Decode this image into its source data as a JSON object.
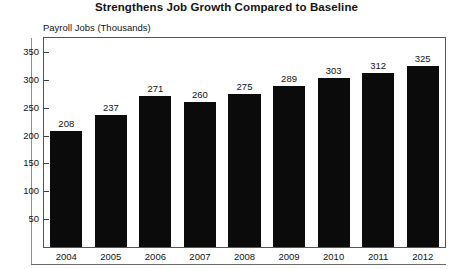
{
  "chart_data": {
    "type": "bar",
    "title": "Strengthens Job Growth Compared to Baseline",
    "ylabel": "Payroll Jobs (Thousands)",
    "xlabel": "",
    "categories": [
      "2004",
      "2005",
      "2006",
      "2007",
      "2008",
      "2009",
      "2010",
      "2011",
      "2012"
    ],
    "values": [
      208,
      237,
      271,
      260,
      275,
      289,
      303,
      312,
      325
    ],
    "value_labels": [
      "208",
      "237",
      "271",
      "260",
      "275",
      "289",
      "303",
      "312",
      "325"
    ],
    "yticks": [
      50,
      100,
      150,
      200,
      250,
      300,
      350
    ],
    "ytick_labels": [
      "50",
      "100",
      "150",
      "200",
      "250",
      "300",
      "350"
    ],
    "ylim": [
      0,
      375
    ],
    "grid": false,
    "legend": null,
    "bar_color": "#0b0b0b",
    "frame_color": "#555555",
    "text_color": "#141414"
  }
}
